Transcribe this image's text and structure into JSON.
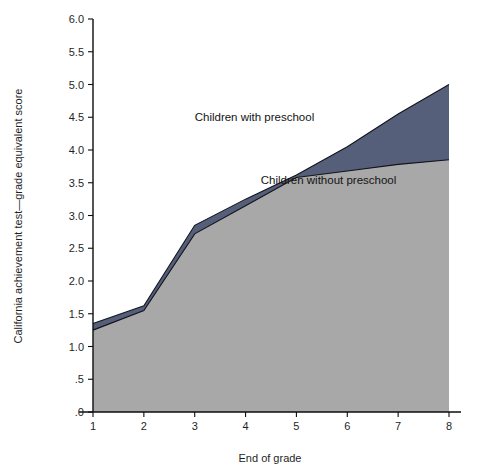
{
  "chart_data": {
    "type": "area",
    "title": "",
    "xlabel": "End of grade",
    "ylabel": "California achievement test—grade equivalent score",
    "x": [
      1,
      2,
      3,
      4,
      5,
      6,
      7,
      8
    ],
    "xtick_labels": [
      "1",
      "2",
      "3",
      "4",
      "5",
      "6",
      "7",
      "8"
    ],
    "ytick_labels": [
      ".0",
      ".5",
      "1.0",
      "1.5",
      "2.0",
      "2.5",
      "3.0",
      "3.5",
      "4.0",
      "4.5",
      "5.0",
      "5.5",
      "6.0"
    ],
    "ytick_values": [
      0.0,
      0.5,
      1.0,
      1.5,
      2.0,
      2.5,
      3.0,
      3.5,
      4.0,
      4.5,
      5.0,
      5.5,
      6.0
    ],
    "xlim": [
      1,
      8
    ],
    "ylim": [
      0.0,
      6.0
    ],
    "grid": false,
    "legend_position": "inline-annotations",
    "series": [
      {
        "name": "Children with preschool",
        "values": [
          1.35,
          1.62,
          2.85,
          3.25,
          3.62,
          4.05,
          4.55,
          5.0
        ],
        "color": "#565f7a",
        "label_x": 3.0,
        "label_y": 4.45
      },
      {
        "name": "Children without preschool",
        "values": [
          1.25,
          1.55,
          2.72,
          3.15,
          3.58,
          3.68,
          3.78,
          3.85
        ],
        "color": "#a8a8a8",
        "label_x": 4.3,
        "label_y": 3.48
      }
    ]
  },
  "annotations": {
    "with_preschool_label": "Children with preschool",
    "without_preschool_label": "Children without preschool"
  },
  "axes": {
    "x_axis_title": "End of grade",
    "y_axis_title": "California achievement test—grade equivalent score"
  },
  "colors": {
    "upper_area": "#565f7a",
    "lower_area": "#a8a8a8",
    "axis": "#0d0d0d",
    "background": "#ffffff"
  }
}
